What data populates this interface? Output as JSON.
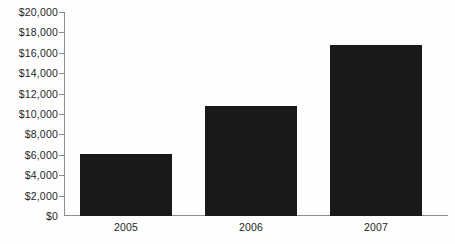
{
  "chart_data": {
    "type": "bar",
    "title": "",
    "subtitle": "",
    "xlabel": "",
    "ylabel": "",
    "categories": [
      "2005",
      "2006",
      "2007"
    ],
    "values": [
      6100,
      10800,
      16800
    ],
    "series": [
      {
        "name": "",
        "values": [
          6100,
          10800,
          16800
        ]
      }
    ],
    "ylim": [
      0,
      20000
    ],
    "ytick_step": 2000,
    "ytick_labels": [
      "$20,000",
      "$18,000",
      "$16,000",
      "$14,000",
      "$12,000",
      "$10,000",
      "$8,000",
      "$6,000",
      "$4,000",
      "$2,000",
      "$0"
    ],
    "ytick_values": [
      20000,
      18000,
      16000,
      14000,
      12000,
      10000,
      8000,
      6000,
      4000,
      2000,
      0
    ],
    "grid": false,
    "legend": false,
    "legend_position": "none",
    "bar_color": "#191919",
    "axis_color": "#8e8e8e",
    "text_color": "#262626",
    "background_color": "#fefefe"
  }
}
